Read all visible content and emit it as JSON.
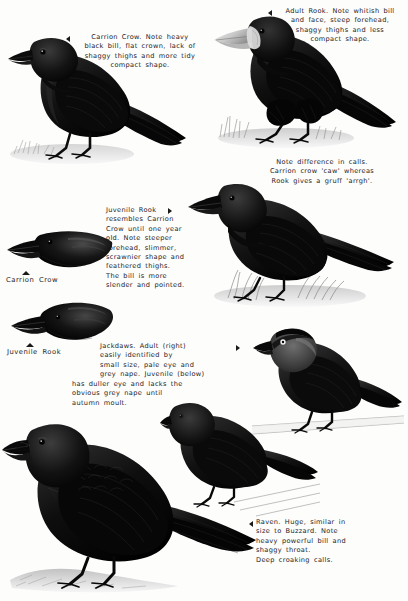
{
  "page": {
    "background_color": "#fdfdfc",
    "ink_color": "#24221f",
    "width": 408,
    "height": 601
  },
  "captions": {
    "carrion_crow": "Carrion Crow. Note heavy\nblack bill, flat crown, lack of\nshaggy thighs and more tidy\ncompact shape.",
    "adult_rook": "Adult Rook. Note whitish bill\nand face, steep forehead,\nshaggy thighs and less\ncompact shape.",
    "calls": "Note difference in calls.\nCarrion crow 'caw' whereas\nRook gives a gruff 'arrgh'.",
    "juvenile_rook": "Juvenile Rook\nresembles Carrion\nCrow until one year\nold. Note steeper\nforehead, slimmer,\nscrawnier shape and\nfeathered thighs.\nThe bill is more\nslender and pointed.",
    "jackdaws_indented": "Jackdaws. Adult (right)\neasily identified by\nsmall size, pale eye and\ngrey nape. Juvenile (below)",
    "jackdaws_continued": "has duller eye and lacks the\nobvious grey nape until\nautumn moult.",
    "raven": "Raven. Huge, similar in\nsize to Buzzard. Note\nheavy powerful bill and\nshaggy throat.\nDeep croaking calls."
  },
  "labels": {
    "carrion_crow_head": "Carrion Crow",
    "juvenile_rook_head": "Juvenile Rook"
  },
  "pointers": {
    "carrion_crow": "left-pointing-triangle",
    "adult_rook": "left-pointing-triangle",
    "juvenile_rook": "right-pointing-triangle",
    "jackdaws": "right-pointing-triangle",
    "raven": "left-pointing-triangle",
    "carrion_crow_head": "up-pointing-triangle",
    "juvenile_rook_head": "up-pointing-triangle"
  },
  "illustrations": [
    {
      "name": "carrion-crow-full-body",
      "species": "Carrion Crow",
      "pose": "standing, facing left"
    },
    {
      "name": "adult-rook-full-body",
      "species": "Adult Rook",
      "pose": "standing, facing left"
    },
    {
      "name": "carrion-crow-head-profile",
      "species": "Carrion Crow",
      "pose": "head profile, facing left"
    },
    {
      "name": "juvenile-rook-head-profile",
      "species": "Juvenile Rook",
      "pose": "head profile, facing left"
    },
    {
      "name": "juvenile-rook-full-body",
      "species": "Juvenile Rook",
      "pose": "standing, facing left"
    },
    {
      "name": "jackdaw-adult",
      "species": "Jackdaw (adult)",
      "pose": "standing, facing left"
    },
    {
      "name": "jackdaw-juvenile",
      "species": "Jackdaw (juvenile)",
      "pose": "standing, facing left"
    },
    {
      "name": "raven-full-body",
      "species": "Raven",
      "pose": "standing, facing left"
    }
  ]
}
